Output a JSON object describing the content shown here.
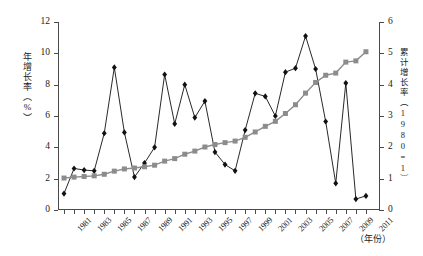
{
  "chart_data": {
    "type": "line",
    "title": "",
    "xlabel": "（年份）",
    "x": [
      1981,
      1982,
      1983,
      1984,
      1985,
      1986,
      1987,
      1988,
      1989,
      1990,
      1991,
      1992,
      1993,
      1994,
      1995,
      1996,
      1997,
      1998,
      1999,
      2000,
      2001,
      2002,
      2003,
      2004,
      2005,
      2006,
      2007,
      2008,
      2009,
      2010,
      2011
    ],
    "x_tick_labels": [
      "1981",
      "1983",
      "1985",
      "1987",
      "1989",
      "1991",
      "1993",
      "1995",
      "1997",
      "1999",
      "2001",
      "2003",
      "2005",
      "2007",
      "2009",
      "2011"
    ],
    "grid": false,
    "legend_position": "none",
    "axes": {
      "left": {
        "label": "年增长率（%）",
        "ylim": [
          0,
          12
        ],
        "ticks": [
          0,
          2,
          4,
          6,
          8,
          10,
          12
        ],
        "tick_labels": [
          "0",
          "2",
          "4",
          "6",
          "8",
          "10",
          "12"
        ]
      },
      "right": {
        "label": "累计增长率（1980=1）",
        "ylim": [
          0,
          6
        ],
        "ticks": [
          0,
          1,
          2,
          3,
          4,
          5,
          6
        ],
        "tick_labels": [
          "0",
          "1",
          "2",
          "3",
          "4",
          "5",
          "6"
        ]
      }
    },
    "series": [
      {
        "name": "年增长率",
        "axis": "left",
        "marker": "diamond",
        "color": "#111111",
        "values": [
          1.05,
          2.65,
          2.55,
          2.5,
          4.9,
          9.1,
          4.95,
          2.1,
          3.0,
          4.0,
          8.65,
          5.5,
          8.0,
          5.9,
          6.95,
          3.7,
          2.9,
          2.5,
          5.1,
          7.45,
          7.25,
          6.0,
          8.8,
          9.05,
          11.1,
          9.0,
          5.65,
          1.7,
          8.1,
          0.7,
          0.9
        ]
      },
      {
        "name": "累计增长率",
        "axis": "right",
        "marker": "square",
        "color": "#8c8c8c",
        "values": [
          1.02,
          1.05,
          1.07,
          1.09,
          1.14,
          1.24,
          1.31,
          1.34,
          1.38,
          1.43,
          1.56,
          1.64,
          1.78,
          1.88,
          2.01,
          2.09,
          2.15,
          2.2,
          2.32,
          2.49,
          2.67,
          2.83,
          3.08,
          3.36,
          3.73,
          4.07,
          4.3,
          4.37,
          4.72,
          4.76,
          5.05
        ]
      }
    ]
  }
}
